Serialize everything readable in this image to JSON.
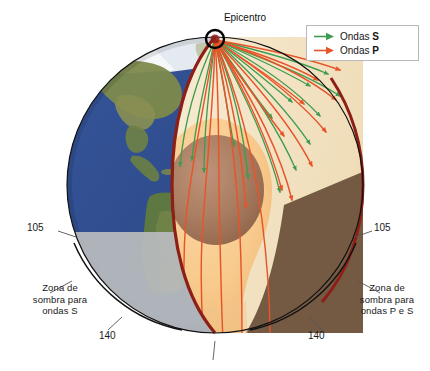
{
  "figure": {
    "title_label": "Epicentro"
  },
  "legend": {
    "items": [
      {
        "label_prefix": "Ondas ",
        "label_bold": "S",
        "color": "#3f9b4f",
        "icon": "arrow-right-icon"
      },
      {
        "label_prefix": "Ondas ",
        "label_bold": "P",
        "color": "#e8542a",
        "icon": "arrow-right-icon"
      }
    ]
  },
  "annotations": {
    "shadow_left": "Zona de\nsombra para\nondas S",
    "shadow_right": "Zona de\nsombra para\nondas P e S",
    "angle_left_inner": "105",
    "angle_right_inner": "105",
    "angle_left_outer": "140",
    "angle_right_outer": "140"
  },
  "colors": {
    "s_wave": "#3f9b4f",
    "p_wave": "#e8542a",
    "cut_edge": "#8e1f17",
    "ocean": "#2e4f93",
    "land": "#6b7b3f",
    "shadow_gray": "#b9bbbd",
    "shadow_brown": "#6d523c",
    "mantle_light": "#f2e4c6",
    "outer_core": "#f6c храм88",
    "inner_core": "#a8795f",
    "outline": "#111111"
  },
  "layers": {
    "crust_mantle": "manto",
    "outer_core": "nucleo externo",
    "inner_core": "nucleo interno"
  }
}
